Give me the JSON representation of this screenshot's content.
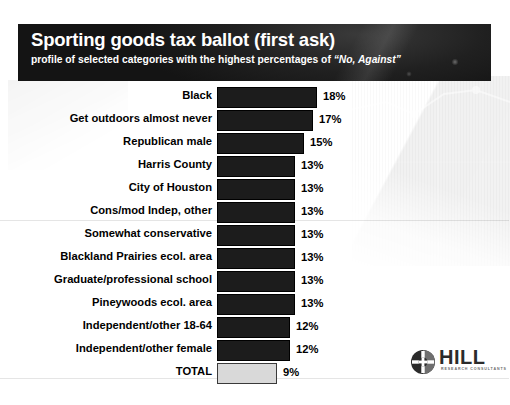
{
  "header": {
    "title": "Sporting goods tax ballot (first ask)",
    "subtitle_prefix": "profile of selected categories with the highest percentages of ",
    "subtitle_quote": "“No, Against”"
  },
  "logo": {
    "wordmark": "HILL",
    "tagline": "RESEARCH CONSULTANTS",
    "mark_icon": "hill-circle-logo-icon"
  },
  "colors": {
    "header_band": "#161616",
    "bar_fill": "#1c1c1c",
    "total_bar_fill": "#d9d9d9",
    "page_background": "#ffffff",
    "text": "#000000"
  },
  "chart_data": {
    "type": "bar",
    "orientation": "horizontal",
    "title": "Sporting goods tax ballot (first ask)",
    "subtitle": "profile of selected categories with the highest percentages of “No, Against”",
    "xlabel": "",
    "ylabel": "",
    "xlim": [
      0,
      20
    ],
    "grid": false,
    "legend": false,
    "value_suffix": "%",
    "categories": [
      "Black",
      "Get outdoors almost never",
      "Republican male",
      "Harris County",
      "City of Houston",
      "Cons/mod Indep, other",
      "Somewhat conservative",
      "Blackland Prairies ecol. area",
      "Graduate/professional school",
      "Pineywoods ecol. area",
      "Independent/other 18-64",
      "Independent/other female",
      "TOTAL"
    ],
    "values": [
      18,
      17,
      15,
      13,
      13,
      13,
      13,
      13,
      13,
      13,
      12,
      12,
      9
    ],
    "value_labels": [
      "18%",
      "17%",
      "15%",
      "13%",
      "13%",
      "13%",
      "13%",
      "13%",
      "13%",
      "13%",
      "12%",
      "12%",
      "9%"
    ],
    "highlight_index": 12,
    "highlight_note": "TOTAL row drawn as light gray bar"
  }
}
